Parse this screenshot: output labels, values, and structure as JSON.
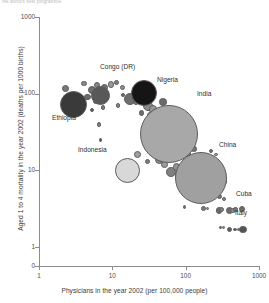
{
  "top_caption": "the world's best programme",
  "chart_data": {
    "type": "scatter",
    "title": "",
    "subtitle": "",
    "xlabel": "Physicians in the year 2002 (per 100,000 people)",
    "ylabel": "Aged 1 to 4 mortality in the year 2002 (deaths per 1000 births)",
    "xscale": "log",
    "yscale": "log",
    "xlim": [
      1,
      1000
    ],
    "ylim": [
      1,
      1000
    ],
    "grid": false,
    "legend": "none",
    "xticks": [
      "1",
      "10",
      "100",
      "1000"
    ],
    "yticks": [
      "1000",
      "100",
      "10",
      "1",
      "0"
    ],
    "bubble_encoding": "marker area proportional to country population",
    "annotations": [
      "Ethiopia",
      "Congo (DR)",
      "Nigeria",
      "India",
      "Indonesia",
      "China",
      "Cuba",
      "Italy"
    ],
    "points": [
      {
        "label": "Ethiopia",
        "x": 3.0,
        "y": 72,
        "r": 13.5,
        "fill": "#3a3a3a"
      },
      {
        "label": "Congo (DR)",
        "x": 6.9,
        "y": 95,
        "r": 9.5,
        "fill": "#585858"
      },
      {
        "label": "Nigeria",
        "x": 27.0,
        "y": 103,
        "r": 13.0,
        "fill": "#151515"
      },
      {
        "label": "India",
        "x": 59.0,
        "y": 30,
        "r": 29.0,
        "fill": "#a8a8a8"
      },
      {
        "label": "Indonesia",
        "x": 16.0,
        "y": 10,
        "r": 12.5,
        "fill": "#d8d8d8"
      },
      {
        "label": "China",
        "x": 164.0,
        "y": 8.0,
        "r": 26.0,
        "fill": "#a0a0a0"
      },
      {
        "label": "Cuba",
        "x": 591.0,
        "y": 3.1,
        "r": 3.0,
        "fill": "#6d6d6d"
      },
      {
        "label": "Italy",
        "x": 606.0,
        "y": 1.7,
        "r": 3.6,
        "fill": "#555555"
      }
    ],
    "unlabeled_points": [
      {
        "x": 2.3,
        "y": 118,
        "r": 3.6,
        "fill": "#7a7a7a"
      },
      {
        "x": 4.1,
        "y": 135,
        "r": 2.6,
        "fill": "#8a8a8a"
      },
      {
        "x": 5.2,
        "y": 112,
        "r": 4.0,
        "fill": "#6f6f6f"
      },
      {
        "x": 6.2,
        "y": 128,
        "r": 3.0,
        "fill": "#858585"
      },
      {
        "x": 7.8,
        "y": 120,
        "r": 3.4,
        "fill": "#707070"
      },
      {
        "x": 9.6,
        "y": 132,
        "r": 3.2,
        "fill": "#9a9a9a"
      },
      {
        "x": 11.5,
        "y": 140,
        "r": 2.4,
        "fill": "#7d7d7d"
      },
      {
        "x": 13.8,
        "y": 120,
        "r": 2.6,
        "fill": "#8f8f8f"
      },
      {
        "x": 4.6,
        "y": 90,
        "r": 3.2,
        "fill": "#6a6a6a"
      },
      {
        "x": 6.0,
        "y": 80,
        "r": 2.6,
        "fill": "#909090"
      },
      {
        "x": 5.3,
        "y": 62,
        "r": 2.0,
        "fill": "#5f5f5f"
      },
      {
        "x": 7.4,
        "y": 66,
        "r": 2.2,
        "fill": "#7f7f7f"
      },
      {
        "x": 6.6,
        "y": 40,
        "r": 2.4,
        "fill": "#888888"
      },
      {
        "x": 6.9,
        "y": 25,
        "r": 1.9,
        "fill": "#4d4d4d"
      },
      {
        "x": 17.5,
        "y": 86,
        "r": 6.0,
        "fill": "#6e6e6e"
      },
      {
        "x": 21.0,
        "y": 78,
        "r": 3.0,
        "fill": "#7c7c7c"
      },
      {
        "x": 14.0,
        "y": 96,
        "r": 2.0,
        "fill": "#6b6b6b"
      },
      {
        "x": 12.0,
        "y": 70,
        "r": 2.2,
        "fill": "#888888"
      },
      {
        "x": 31.0,
        "y": 70,
        "r": 5.0,
        "fill": "#8b8b8b"
      },
      {
        "x": 36.0,
        "y": 62,
        "r": 4.2,
        "fill": "#989898"
      },
      {
        "x": 33.0,
        "y": 52,
        "r": 3.4,
        "fill": "#777777"
      },
      {
        "x": 25.0,
        "y": 56,
        "r": 2.6,
        "fill": "#6e6e6e"
      },
      {
        "x": 41.0,
        "y": 45,
        "r": 3.2,
        "fill": "#8c8c8c"
      },
      {
        "x": 27.0,
        "y": 33,
        "r": 2.0,
        "fill": "#7a7a7a"
      },
      {
        "x": 49.0,
        "y": 78,
        "r": 3.8,
        "fill": "#6a6a6a"
      },
      {
        "x": 55.0,
        "y": 60,
        "r": 2.8,
        "fill": "#8d8d8d"
      },
      {
        "x": 22.0,
        "y": 16,
        "r": 3.6,
        "fill": "#9f9f9f"
      },
      {
        "x": 30.0,
        "y": 13,
        "r": 2.8,
        "fill": "#7b7b7b"
      },
      {
        "x": 44.0,
        "y": 14,
        "r": 4.4,
        "fill": "#8a8a8a"
      },
      {
        "x": 52.0,
        "y": 12,
        "r": 3.4,
        "fill": "#9b9b9b"
      },
      {
        "x": 63.0,
        "y": 9.5,
        "r": 4.8,
        "fill": "#808080"
      },
      {
        "x": 75.0,
        "y": 11,
        "r": 3.8,
        "fill": "#929292"
      },
      {
        "x": 86.0,
        "y": 8.5,
        "r": 5.6,
        "fill": "#8e8e8e"
      },
      {
        "x": 96.0,
        "y": 6.8,
        "r": 4.0,
        "fill": "#757575"
      },
      {
        "x": 108.0,
        "y": 9.0,
        "r": 3.2,
        "fill": "#9d9d9d"
      },
      {
        "x": 120.0,
        "y": 7.2,
        "r": 4.6,
        "fill": "#848484"
      },
      {
        "x": 135.0,
        "y": 5.6,
        "r": 3.6,
        "fill": "#8b8b8b"
      },
      {
        "x": 150.0,
        "y": 6.4,
        "r": 2.8,
        "fill": "#6f6f6f"
      },
      {
        "x": 180.0,
        "y": 5.2,
        "r": 3.0,
        "fill": "#979797"
      },
      {
        "x": 205.0,
        "y": 6.0,
        "r": 3.4,
        "fill": "#7e7e7e"
      },
      {
        "x": 240.0,
        "y": 5.0,
        "r": 3.0,
        "fill": "#8a8a8a"
      },
      {
        "x": 290.0,
        "y": 4.6,
        "r": 2.6,
        "fill": "#787878"
      },
      {
        "x": 330.0,
        "y": 4.2,
        "r": 2.0,
        "fill": "#8f8f8f"
      },
      {
        "x": 152.0,
        "y": 13,
        "r": 2.2,
        "fill": "#6c6c6c"
      },
      {
        "x": 175.0,
        "y": 11,
        "r": 1.8,
        "fill": "#858585"
      },
      {
        "x": 210.0,
        "y": 13,
        "r": 2.4,
        "fill": "#8a8a8a"
      },
      {
        "x": 250.0,
        "y": 10,
        "r": 1.8,
        "fill": "#707070"
      },
      {
        "x": 225.0,
        "y": 18,
        "r": 2.0,
        "fill": "#7d7d7d"
      },
      {
        "x": 260.0,
        "y": 16,
        "r": 1.6,
        "fill": "#939393"
      },
      {
        "x": 300.0,
        "y": 8.5,
        "r": 2.0,
        "fill": "#7a7a7a"
      },
      {
        "x": 350.0,
        "y": 7.0,
        "r": 1.8,
        "fill": "#8c8c8c"
      },
      {
        "x": 96.0,
        "y": 3.3,
        "r": 1.8,
        "fill": "#6f6f6f"
      },
      {
        "x": 175.0,
        "y": 3.2,
        "r": 2.4,
        "fill": "#7b7b7b"
      },
      {
        "x": 200.0,
        "y": 3.2,
        "r": 1.6,
        "fill": "#8a8a8a"
      },
      {
        "x": 285.0,
        "y": 3.0,
        "r": 3.2,
        "fill": "#6b6b6b"
      },
      {
        "x": 310.0,
        "y": 3.1,
        "r": 2.6,
        "fill": "#7f7f7f"
      },
      {
        "x": 400.0,
        "y": 3.0,
        "r": 3.4,
        "fill": "#6d6d6d"
      },
      {
        "x": 440.0,
        "y": 3.0,
        "r": 2.8,
        "fill": "#8c8c8c"
      },
      {
        "x": 480.0,
        "y": 3.1,
        "r": 2.2,
        "fill": "#757575"
      },
      {
        "x": 300.0,
        "y": 1.8,
        "r": 1.2,
        "fill": "#6a6a6a"
      },
      {
        "x": 330.0,
        "y": 1.8,
        "r": 1.4,
        "fill": "#888888"
      },
      {
        "x": 400.0,
        "y": 1.7,
        "r": 2.6,
        "fill": "#5e5e5e"
      },
      {
        "x": 470.0,
        "y": 1.7,
        "r": 1.8,
        "fill": "#555555"
      },
      {
        "x": 520.0,
        "y": 1.7,
        "r": 1.6,
        "fill": "#777777"
      },
      {
        "x": 45.0,
        "y": 42,
        "r": 2.4,
        "fill": "#7c7c7c"
      },
      {
        "x": 70.0,
        "y": 20,
        "r": 2.6,
        "fill": "#8e8e8e"
      },
      {
        "x": 80.0,
        "y": 24,
        "r": 2.0,
        "fill": "#6e6e6e"
      },
      {
        "x": 90.0,
        "y": 18,
        "r": 3.0,
        "fill": "#9a9a9a"
      },
      {
        "x": 110.0,
        "y": 16,
        "r": 2.2,
        "fill": "#828282"
      },
      {
        "x": 130.0,
        "y": 19,
        "r": 2.6,
        "fill": "#767676"
      },
      {
        "x": 66.0,
        "y": 48,
        "r": 2.2,
        "fill": "#8a8a8a"
      },
      {
        "x": 58.0,
        "y": 22,
        "r": 1.8,
        "fill": "#6f6f6f"
      }
    ]
  },
  "labels": [
    {
      "text": "Ethiopia",
      "left": 52,
      "top": 114
    },
    {
      "text": "Congo (DR)",
      "left": 100,
      "top": 63
    },
    {
      "text": "Nigeria",
      "left": 157,
      "top": 76
    },
    {
      "text": "India",
      "left": 197,
      "top": 90
    },
    {
      "text": "Indonesia",
      "left": 78,
      "top": 146
    },
    {
      "text": "China",
      "left": 219,
      "top": 141
    },
    {
      "text": "Cuba",
      "left": 236,
      "top": 190
    },
    {
      "text": "Italy",
      "left": 235,
      "top": 209
    }
  ]
}
